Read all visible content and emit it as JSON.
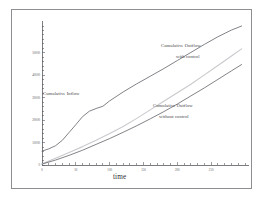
{
  "figure": {
    "background_color": "#ffffff",
    "frame_color": "#8d8d92"
  },
  "chart_data": {
    "type": "line",
    "title": "",
    "xlabel": "time",
    "ylabel": "",
    "grid": false,
    "legend_position": "inline-annotations",
    "xlim": [
      0,
      300
    ],
    "ylim": [
      0,
      62000
    ],
    "x_ticks": [
      0,
      50,
      100,
      150,
      200,
      250
    ],
    "x_tick_labels": [
      "0",
      "50",
      "100",
      "150",
      "200",
      "250"
    ],
    "y_ticks": [
      0,
      10000,
      20000,
      30000,
      40000,
      50000
    ],
    "y_tick_labels": [
      "0",
      "10000",
      "20000",
      "30000",
      "40000",
      "50000"
    ],
    "x_minor_tick_step": 10,
    "y_minor_tick_step": 2000,
    "series": [
      {
        "name": "Cumulative Inflow",
        "color": "#6c6c72",
        "x": [
          0,
          10,
          20,
          30,
          40,
          50,
          60,
          70,
          80,
          90,
          100,
          120,
          140,
          160,
          180,
          200,
          220,
          240,
          260,
          280,
          295
        ],
        "y": [
          6200,
          7200,
          8600,
          11000,
          14500,
          18000,
          21600,
          24000,
          25200,
          26200,
          28600,
          32600,
          36200,
          39600,
          43000,
          46600,
          50200,
          53800,
          57200,
          60200,
          62000
        ]
      },
      {
        "name": "Cumulative Outflow with control",
        "color": "#c9c9ce",
        "x": [
          0,
          20,
          40,
          60,
          80,
          100,
          120,
          140,
          160,
          180,
          200,
          220,
          240,
          260,
          280,
          295
        ],
        "y": [
          500,
          3000,
          5600,
          8200,
          11000,
          14000,
          17200,
          20800,
          24600,
          28400,
          32200,
          36000,
          40200,
          44400,
          48600,
          51800
        ]
      },
      {
        "name": "Cumulative Outflow without control",
        "color": "#6c6c72",
        "x": [
          0,
          20,
          40,
          60,
          80,
          100,
          120,
          140,
          160,
          180,
          200,
          220,
          240,
          260,
          280,
          295
        ],
        "y": [
          400,
          2200,
          4300,
          6600,
          9200,
          11800,
          14600,
          17500,
          20600,
          23800,
          27200,
          30800,
          34400,
          38200,
          42000,
          44800
        ]
      }
    ],
    "annotations": [
      {
        "name": "cumulative-inflow-label",
        "lines": [
          "Cumulative Inflow"
        ],
        "x_px": 42,
        "y_px": 88
      },
      {
        "name": "cumulative-outflow-with-control-label",
        "lines": [
          "Cumulative Outflow",
          "with control"
        ],
        "x_px": 160,
        "y_px": 40
      },
      {
        "name": "cumulative-outflow-without-control-label",
        "lines": [
          "Cumulative Outflow",
          "without control"
        ],
        "x_px": 152,
        "y_px": 100
      }
    ]
  }
}
